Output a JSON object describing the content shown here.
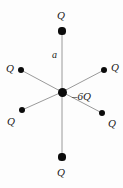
{
  "figure": {
    "background_color": "#fdfdfd",
    "spoke_color": "#9a9a9a",
    "dot_color": "#0b0b0b",
    "label_color": "#1a1a1a",
    "center": {
      "x": 62,
      "y": 92
    },
    "center_charge": {
      "name": "center-charge",
      "label": "–6Q",
      "dot_radius": 4.5,
      "label_x": 72,
      "label_y": 91
    },
    "distance_label": {
      "name": "distance-a",
      "label": "a",
      "x": 52,
      "y": 50
    },
    "outer_charges": [
      {
        "name": "charge-top",
        "label": "Q",
        "dot_x": 62,
        "dot_y": 31,
        "dot_radius": 3.6,
        "label_x": 57,
        "label_y": 10
      },
      {
        "name": "charge-upper-right",
        "label": "Q",
        "dot_x": 104,
        "dot_y": 70,
        "dot_radius": 3.4,
        "label_x": 111,
        "label_y": 62
      },
      {
        "name": "charge-lower-right",
        "label": "Q",
        "dot_x": 102,
        "dot_y": 113,
        "dot_radius": 3.4,
        "label_x": 108,
        "label_y": 118
      },
      {
        "name": "charge-bottom",
        "label": "Q",
        "dot_x": 62,
        "dot_y": 157,
        "dot_radius": 3.6,
        "label_x": 57,
        "label_y": 167
      },
      {
        "name": "charge-lower-left",
        "label": "Q",
        "dot_x": 22,
        "dot_y": 110,
        "dot_radius": 3.4,
        "label_x": 7,
        "label_y": 116
      },
      {
        "name": "charge-upper-left",
        "label": "Q",
        "dot_x": 21,
        "dot_y": 70,
        "dot_radius": 3.4,
        "label_x": 6,
        "label_y": 63
      }
    ]
  }
}
